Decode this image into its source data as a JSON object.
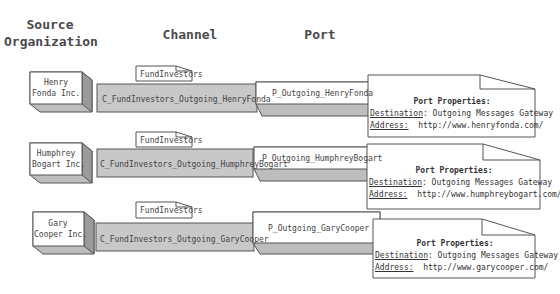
{
  "headers": {
    "source": "Source\nOrganization",
    "source_line1": "Source",
    "source_line2": "Organization",
    "channel": "Channel",
    "port": "Port"
  },
  "rows": [
    {
      "org_line1": "Henry",
      "org_line2": "Fonda Inc.",
      "tag": "FundInvestors",
      "channel": "C_FundInvestors_Outgoing_HenryFonda",
      "port": "P_Outgoing_HenryFonda",
      "props_title": "Port Properties:",
      "dest_label": "Destination",
      "dest_value": ": Outgoing Messages Gateway",
      "addr_label": "Address:",
      "addr_value": "http://www.henryfonda.com/"
    },
    {
      "org_line1": "Humphrey",
      "org_line2": "Bogart Inc.",
      "tag": "FundInvestors",
      "channel": "C_FundInvestors_Outgoing_HumphreyBogart",
      "port": "P_Outgoing_HumphreyBogart",
      "props_title": "Port Properties:",
      "dest_label": "Destination",
      "dest_value": ": Outgoing Messages Gateway",
      "addr_label": "Address:",
      "addr_value": "http://www.humphreybogart.com/"
    },
    {
      "org_line1": "Gary",
      "org_line2": "Cooper Inc.",
      "tag": "FundInvestors",
      "channel": "C_FundInvestors_Outgoing_GaryCooper",
      "port": "P_Outgoing_GaryCooper",
      "props_title": "Port Properties:",
      "dest_label": "Destination",
      "dest_value": ": Outgoing Messages Gateway",
      "addr_label": "Address:",
      "addr_value": "http://www.garycooper.com/"
    }
  ],
  "colors": {
    "box_face": "#ffffff",
    "box_side": "#9a9a9a",
    "box_bottom": "#bdbdbd",
    "channel_fill": "#c8c8c8",
    "stroke": "#555555"
  }
}
